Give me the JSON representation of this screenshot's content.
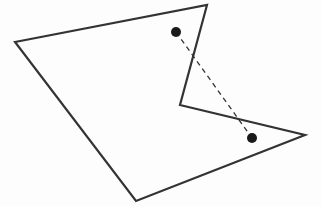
{
  "diagram": {
    "type": "geometry",
    "canvas": {
      "width": 321,
      "height": 207,
      "background": "#fdfdfd"
    },
    "polygon": {
      "vertices": [
        [
          15,
          42
        ],
        [
          207,
          5
        ],
        [
          180,
          105
        ],
        [
          305,
          135
        ],
        [
          136,
          201
        ]
      ],
      "stroke": "#333333",
      "stroke_width": 2.2,
      "fill": "none"
    },
    "points": [
      {
        "id": "A",
        "x": 176,
        "y": 32,
        "r": 5,
        "fill": "#1a1a1a"
      },
      {
        "id": "B",
        "x": 252,
        "y": 138,
        "r": 5,
        "fill": "#1a1a1a"
      }
    ],
    "segment": {
      "from": "A",
      "to": "B",
      "stroke": "#333333",
      "stroke_width": 1.3,
      "dash": "5,4"
    }
  }
}
